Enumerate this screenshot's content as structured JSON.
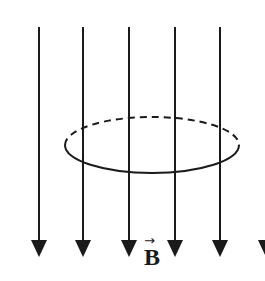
{
  "diagram": {
    "field_label": "B",
    "field_vector_arrow": "→",
    "field_direction": "down",
    "colors": {
      "line": "#1a1a1a",
      "background": "#ffffff"
    },
    "field_lines_x": [
      39,
      83,
      129,
      175,
      220,
      266
    ],
    "field_line_top_y": 27,
    "arrow_tip_y": 257,
    "loop": {
      "cx": 152,
      "cy": 145,
      "rx": 87,
      "ry": 28
    }
  }
}
